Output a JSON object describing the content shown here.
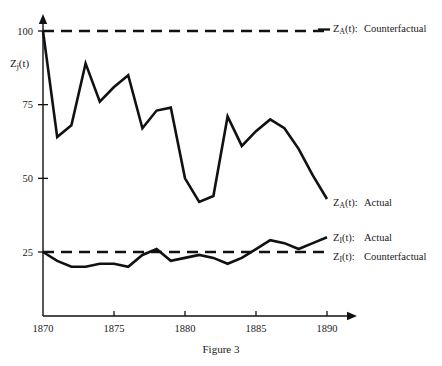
{
  "figure": {
    "caption_line1": "Figure 3"
  },
  "axes": {
    "ylabel_main": "Z",
    "ylabel_sub": "j",
    "ylabel_tail": "(t)",
    "y_ticks": [
      25,
      50,
      75,
      100
    ],
    "y_tick_labels": [
      "25",
      "50",
      "75",
      "100"
    ],
    "x_ticks": [
      1870,
      1875,
      1880,
      1885,
      1890
    ],
    "x_tick_labels": [
      "1870",
      "1875",
      "1880",
      "1885",
      "1890"
    ]
  },
  "legend": {
    "items": [
      {
        "id": "za-counterfactual",
        "sym": "Z",
        "sub": "A",
        "tail": "(t):",
        "label": "Counterfactual",
        "style": "dashed"
      },
      {
        "id": "za-actual",
        "sym": "Z",
        "sub": "A",
        "tail": "(t):",
        "label": "Actual",
        "style": "solid"
      },
      {
        "id": "zi-actual",
        "sym": "Z",
        "sub": "I",
        "tail": "(t):",
        "label": "Actual",
        "style": "solid"
      },
      {
        "id": "zi-counterfactual",
        "sym": "Z",
        "sub": "I",
        "tail": "(t):",
        "label": "Counterfactual",
        "style": "dashed"
      }
    ]
  },
  "chart_data": {
    "type": "line",
    "title": "",
    "xlabel": "",
    "ylabel": "Zj(t)",
    "xlim": [
      1870,
      1890
    ],
    "ylim": [
      0,
      105
    ],
    "grid": false,
    "legend_position": "right",
    "x": [
      1870,
      1871,
      1872,
      1873,
      1874,
      1875,
      1876,
      1877,
      1878,
      1879,
      1880,
      1881,
      1882,
      1883,
      1884,
      1885,
      1886,
      1887,
      1888,
      1889,
      1890
    ],
    "series": [
      {
        "name": "Z_A(t): Actual",
        "style": "solid",
        "values": [
          100,
          64,
          68,
          89,
          76,
          81,
          85,
          67,
          73,
          74,
          50,
          42,
          44,
          71,
          61,
          66,
          70,
          67,
          60,
          51,
          43
        ]
      },
      {
        "name": "Z_A(t): Counterfactual",
        "style": "dashed",
        "constant": 100,
        "values": [
          100,
          100,
          100,
          100,
          100,
          100,
          100,
          100,
          100,
          100,
          100,
          100,
          100,
          100,
          100,
          100,
          100,
          100,
          100,
          100,
          100
        ]
      },
      {
        "name": "Z_I(t): Actual",
        "style": "solid",
        "values": [
          25,
          22,
          20,
          20,
          21,
          21,
          20,
          24,
          26,
          22,
          23,
          24,
          23,
          21,
          23,
          26,
          29,
          28,
          26,
          28,
          30
        ]
      },
      {
        "name": "Z_I(t): Counterfactual",
        "style": "dashed",
        "constant": 25,
        "values": [
          25,
          25,
          25,
          25,
          25,
          25,
          25,
          25,
          25,
          25,
          25,
          25,
          25,
          25,
          25,
          25,
          25,
          25,
          25,
          25,
          25
        ]
      }
    ]
  },
  "geometry": {
    "x0_px": 43,
    "x1_px": 327,
    "year0": 1870,
    "year1": 1890,
    "y_at_25_px": 252,
    "y_at_100_px": 31,
    "baseline_px": 316,
    "arrow_x_px": 357,
    "arrow_top_y_px": 14
  }
}
